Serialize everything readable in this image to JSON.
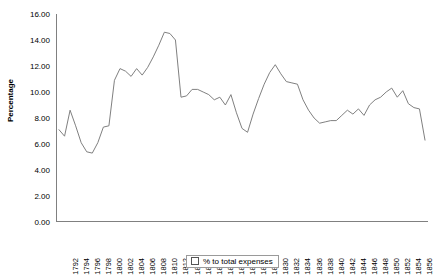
{
  "chart_data": {
    "type": "line",
    "title": "",
    "subtitle": "",
    "xlabel": "",
    "ylabel": "Percentage",
    "ylim": [
      0,
      16
    ],
    "ytick_step": 2,
    "yticks": [
      "0.00",
      "2.00",
      "4.00",
      "6.00",
      "8.00",
      "10.00",
      "12.00",
      "14.00",
      "16.00"
    ],
    "grid": false,
    "legend_position": "bottom",
    "legend": [
      "% to total expenses"
    ],
    "series": [
      {
        "name": "% to total expenses",
        "color": "#808080",
        "x": [
          1792,
          1793,
          1794,
          1795,
          1796,
          1797,
          1798,
          1799,
          1800,
          1801,
          1802,
          1803,
          1804,
          1805,
          1806,
          1807,
          1808,
          1809,
          1810,
          1811,
          1812,
          1813,
          1814,
          1815,
          1816,
          1817,
          1818,
          1819,
          1820,
          1821,
          1822,
          1823,
          1824,
          1825,
          1826,
          1827,
          1828,
          1829,
          1830,
          1831,
          1832,
          1833,
          1834,
          1835,
          1836,
          1837,
          1838,
          1839,
          1840,
          1841,
          1842,
          1843,
          1844,
          1845,
          1846,
          1847,
          1848,
          1849,
          1850,
          1851,
          1852,
          1853,
          1854,
          1855,
          1856,
          1857,
          1858
        ],
        "values": [
          7.1,
          6.6,
          8.6,
          7.4,
          6.1,
          5.4,
          5.3,
          6.1,
          7.3,
          7.4,
          10.9,
          11.8,
          11.6,
          11.2,
          11.8,
          11.3,
          11.9,
          12.7,
          13.6,
          14.6,
          14.5,
          14.0,
          9.6,
          9.7,
          10.2,
          10.2,
          10.0,
          9.8,
          9.4,
          9.6,
          9.0,
          9.8,
          8.4,
          7.2,
          6.9,
          8.3,
          9.5,
          10.6,
          11.5,
          12.1,
          11.4,
          10.8,
          10.7,
          10.6,
          9.4,
          8.6,
          8.0,
          7.6,
          7.7,
          7.8,
          7.8,
          8.2,
          8.6,
          8.3,
          8.7,
          8.2,
          9.0,
          9.4,
          9.6,
          10.0,
          10.3,
          9.6,
          10.1,
          9.1,
          8.8,
          8.7,
          6.3
        ]
      }
    ],
    "xtick_labels": [
      "1792",
      "1794",
      "1796",
      "1798",
      "1800",
      "1802",
      "1804",
      "1806",
      "1808",
      "1810",
      "1812",
      "1814",
      "1816",
      "1818",
      "1820",
      "1822",
      "1824",
      "1826",
      "1828",
      "1830",
      "1832",
      "1834",
      "1836",
      "1838",
      "1840",
      "1842",
      "1844",
      "1846",
      "1848",
      "1850",
      "1852",
      "1854",
      "1856",
      "1858"
    ],
    "axis_color": "#808080",
    "text_color": "#000000"
  }
}
